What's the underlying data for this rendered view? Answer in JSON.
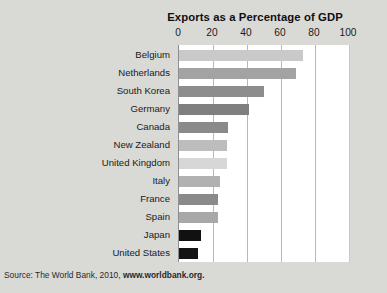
{
  "chart_data": {
    "type": "bar",
    "orientation": "horizontal",
    "title": "Exports as a Percentage of GDP",
    "xlabel": "",
    "ylabel": "",
    "xlim": [
      0,
      100
    ],
    "xticks": [
      0,
      20,
      40,
      60,
      80,
      100
    ],
    "grid": "vertical",
    "legend": "none",
    "categories": [
      "Belgium",
      "Netherlands",
      "South Korea",
      "Germany",
      "Canada",
      "New Zealand",
      "United Kingdom",
      "Italy",
      "France",
      "Spain",
      "Japan",
      "United States"
    ],
    "values": [
      73,
      69,
      50,
      41,
      29,
      28,
      28,
      24,
      23,
      23,
      13,
      11
    ],
    "bar_colors": [
      "#c9c9c9",
      "#a3a3a3",
      "#8d8d8d",
      "#7f7f7f",
      "#8a8a8a",
      "#bdbdbd",
      "#d7d7d7",
      "#b1b1b1",
      "#8a8a8a",
      "#a8a8a8",
      "#111111",
      "#141414"
    ]
  },
  "source": {
    "prefix": "Source: The World Bank, 2010, ",
    "url": "www.worldbank.org."
  },
  "colors": {
    "page_background": "#d9d9d6",
    "plot_background": "#ffffff",
    "gridline": "#b8b8b8",
    "axis": "#8e8e8e",
    "text": "#1a1a1a"
  }
}
